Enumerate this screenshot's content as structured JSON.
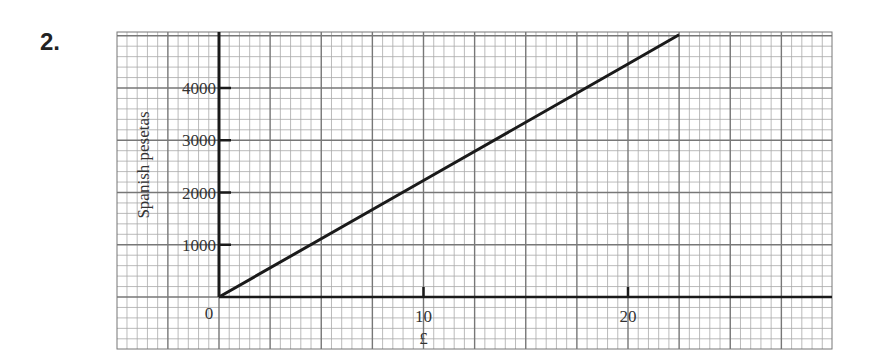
{
  "question_number": "2.",
  "chart_data": {
    "type": "line",
    "title": "",
    "xlabel": "£",
    "ylabel": "Spanish pesetas",
    "x_ticks": [
      0,
      10,
      20
    ],
    "y_ticks": [
      1000,
      2000,
      3000,
      4000
    ],
    "origin_label": "0",
    "xlim": [
      -5,
      30
    ],
    "ylim": [
      -1000,
      5100
    ],
    "grid": true,
    "legend": null,
    "series": [
      {
        "name": "Pounds to Spanish pesetas conversion",
        "x": [
          0,
          10,
          20,
          22.5
        ],
        "y": [
          0,
          2230,
          4460,
          5020
        ],
        "color": "#1a1a1a"
      }
    ]
  }
}
